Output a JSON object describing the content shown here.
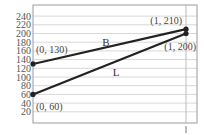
{
  "chart_data": {
    "type": "line",
    "title": "",
    "xlabel": "",
    "ylabel": "",
    "x_ticks": [
      "1"
    ],
    "y_ticks": [
      20,
      40,
      60,
      80,
      100,
      120,
      140,
      160,
      180,
      200,
      220,
      240
    ],
    "xlim": [
      0,
      1
    ],
    "ylim": [
      0,
      250
    ],
    "grid": true,
    "legend": "none",
    "series": [
      {
        "name": "B",
        "x": [
          0,
          1
        ],
        "values": [
          130,
          210
        ]
      },
      {
        "name": "L",
        "x": [
          0,
          1
        ],
        "values": [
          60,
          200
        ]
      }
    ],
    "annotations": [
      {
        "text": "(0, 130)",
        "x": 0,
        "y": 130
      },
      {
        "text": "(1, 210)",
        "x": 1,
        "y": 210
      },
      {
        "text": "(1, 200)",
        "x": 1,
        "y": 200
      },
      {
        "text": "(0, 60)",
        "x": 0,
        "y": 60
      }
    ],
    "colors": {
      "line": "#222222",
      "grid": "#d8d8d8",
      "frame": "#999999"
    }
  }
}
